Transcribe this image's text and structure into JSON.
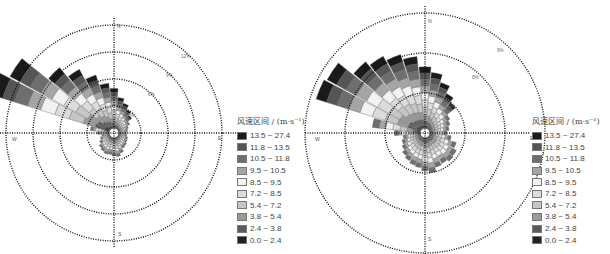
{
  "chart_data": [
    {
      "type": "wind-rose",
      "title": "",
      "directions": [
        "N",
        "E",
        "S",
        "W"
      ],
      "radial_ticks": [
        "3%",
        "6%",
        "9%",
        "12%"
      ],
      "radial_max_percent": 12,
      "legend": {
        "title": "风速区间 / (m·s⁻¹)",
        "entries": [
          {
            "label": "13.5 ~ 27.4",
            "color": "#1a1a1a"
          },
          {
            "label": "11.8 ~ 13.5",
            "color": "#555555"
          },
          {
            "label": "10.5 ~ 11.8",
            "color": "#6e6e6e"
          },
          {
            "label": "9.5 ~ 10.5",
            "color": "#a5a5a5"
          },
          {
            "label": "8.5 ~ 9.5",
            "color": "#f2f2f2"
          },
          {
            "label": "7.2 ~ 8.5",
            "color": "#dcdcdc"
          },
          {
            "label": "5.4 ~ 7.2",
            "color": "#c6c6c6"
          },
          {
            "label": "3.8 ~ 5.4",
            "color": "#9a9a9a"
          },
          {
            "label": "2.4 ~ 3.8",
            "color": "#5a5a5a"
          },
          {
            "label": "0.0 ~ 2.4",
            "color": "#222222"
          }
        ]
      },
      "sectors_deg_from_north": [
        -67.5,
        -56.25,
        -45,
        -33.75,
        -22.5,
        -11.25,
        0,
        11.25,
        22.5,
        33.75,
        45
      ],
      "sector_total_percent": [
        13.8,
        12.6,
        8.9,
        7.5,
        6.2,
        5.0,
        4.4,
        3.4,
        2.9,
        2.4,
        2.0
      ],
      "notes": "Dominant winds from WNW–NW; small sectors in other directions (~1–3%)."
    },
    {
      "type": "wind-rose",
      "title": "",
      "directions": [
        "N",
        "E",
        "S",
        "W"
      ],
      "radial_ticks": [
        "3%",
        "6%",
        "9%"
      ],
      "radial_max_percent": 9,
      "legend": {
        "title": "风速区间 / (m·s⁻¹)",
        "entries": [
          {
            "label": "13.5 ~ 27.4",
            "color": "#1a1a1a"
          },
          {
            "label": "11.8 ~ 13.5",
            "color": "#555555"
          },
          {
            "label": "10.5 ~ 11.8",
            "color": "#6e6e6e"
          },
          {
            "label": "9.5 ~ 10.5",
            "color": "#a5a5a5"
          },
          {
            "label": "8.5 ~ 9.5",
            "color": "#f2f2f2"
          },
          {
            "label": "7.2 ~ 8.5",
            "color": "#dcdcdc"
          },
          {
            "label": "5.4 ~ 7.2",
            "color": "#c6c6c6"
          },
          {
            "label": "3.8 ~ 5.4",
            "color": "#9a9a9a"
          },
          {
            "label": "2.4 ~ 3.8",
            "color": "#5a5a5a"
          },
          {
            "label": "0.0 ~ 2.4",
            "color": "#222222"
          }
        ]
      },
      "sectors_deg_from_north": [
        -67.5,
        -56.25,
        -45,
        -33.75,
        -22.5,
        -11.25,
        0,
        11.25,
        22.5,
        33.75,
        45
      ],
      "sector_total_percent": [
        8.2,
        8.0,
        6.6,
        6.2,
        5.8,
        5.4,
        4.6,
        4.2,
        3.6,
        3.0,
        2.6
      ],
      "notes": "Broader distribution from W through N; secondary lobes S and SE (~3%)."
    }
  ],
  "left": {
    "labels": {
      "n": "N",
      "e": "E",
      "s": "S",
      "w": "W"
    },
    "rings": [
      "3%",
      "6%",
      "9%",
      "12%"
    ]
  },
  "right": {
    "labels": {
      "n": "N",
      "e": "E",
      "s": "S",
      "w": "W"
    },
    "rings": [
      "3%",
      "6%",
      "9%"
    ]
  },
  "legend": {
    "title": "风速区间 / (m·s⁻¹)",
    "labels": [
      "13.5 ~ 27.4",
      "11.8 ~ 13.5",
      "10.5 ~ 11.8",
      "9.5 ~ 10.5",
      "8.5 ~ 9.5",
      "7.2 ~ 8.5",
      "5.4 ~ 7.2",
      "3.8 ~ 5.4",
      "2.4 ~ 3.8",
      "0.0 ~ 2.4"
    ]
  }
}
